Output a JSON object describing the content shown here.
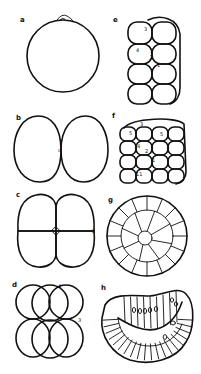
{
  "figure": {
    "panels": [
      {
        "id": "a",
        "label": "a",
        "stage": "single-cell egg"
      },
      {
        "id": "b",
        "label": "b",
        "stage": "2-cell"
      },
      {
        "id": "c",
        "label": "c",
        "stage": "4-cell"
      },
      {
        "id": "d",
        "label": "d",
        "stage": "8-cell"
      },
      {
        "id": "e",
        "label": "e",
        "stage": "16-cell"
      },
      {
        "id": "f",
        "label": "f",
        "stage": "32-cell"
      },
      {
        "id": "g",
        "label": "g",
        "stage": "blastula section"
      },
      {
        "id": "h",
        "label": "h",
        "stage": "gastrula section"
      }
    ],
    "annotations": {
      "b_center": "o",
      "c_side": "2",
      "d_top": "4",
      "d_side": "3",
      "e_marks": [
        "3",
        "4",
        "2",
        "1"
      ],
      "f_marks": [
        "3",
        "5",
        "5",
        "4",
        "2",
        "1",
        "11"
      ]
    },
    "colors": {
      "ink": "#111111",
      "paper": "#ffffff"
    }
  }
}
